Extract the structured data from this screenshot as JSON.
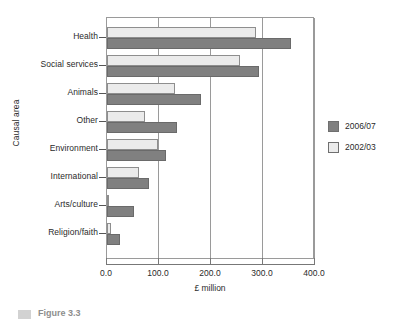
{
  "chart_data": {
    "type": "bar",
    "orientation": "horizontal",
    "title": "",
    "xlabel": "£ million",
    "ylabel": "Causal area",
    "categories": [
      "Health",
      "Social services",
      "Animals",
      "Other",
      "Environment",
      "International",
      "Arts/culture",
      "Religion/faith"
    ],
    "series": [
      {
        "name": "2006/07",
        "color": "#808080",
        "values": [
          354,
          292,
          181,
          134,
          114,
          80,
          52,
          25
        ]
      },
      {
        "name": "2002/03",
        "color": "#ebebeb",
        "values": [
          287,
          256,
          131,
          73,
          98,
          61,
          3,
          7
        ]
      }
    ],
    "xlim": [
      0,
      400
    ],
    "xticks": [
      "0.0",
      "100.0",
      "200.0",
      "300.0",
      "400.0"
    ],
    "xtick_values": [
      0,
      100,
      200,
      300,
      400
    ],
    "grid": "vertical",
    "legend_position": "right"
  },
  "legend": {
    "items": [
      {
        "label": "2006/07",
        "color": "#808080"
      },
      {
        "label": "2002/03",
        "color": "#ebebeb"
      }
    ]
  },
  "caption": {
    "text": "Figure 3.3"
  }
}
